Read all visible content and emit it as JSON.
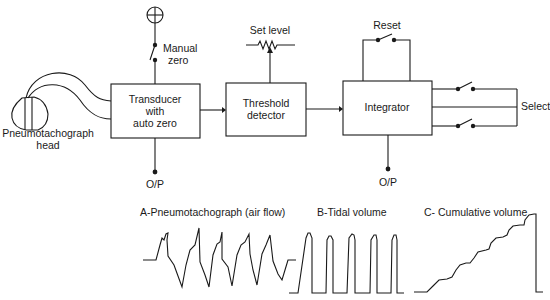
{
  "diagram": {
    "head": {
      "label_line1": "Pneumotachograph",
      "label_line2": "head"
    },
    "transducer": {
      "line1": "Transducer",
      "line2": "with",
      "line3": "auto zero",
      "output": "O/P"
    },
    "manual_zero": {
      "line1": "Manual",
      "line2": "zero"
    },
    "threshold": {
      "line1": "Threshold",
      "line2": "detector",
      "set_level": "Set level"
    },
    "integrator": {
      "label": "Integrator",
      "reset": "Reset",
      "output": "O/P"
    },
    "select": {
      "label": "Select"
    }
  },
  "waveforms": {
    "a": {
      "title": "A-Pneumotachograph (air flow)"
    },
    "b": {
      "title": "B-Tidal volume"
    },
    "c": {
      "title": "C- Cumulative volume"
    }
  },
  "colors": {
    "ink": "#1a1a1a",
    "background": "#ffffff"
  }
}
